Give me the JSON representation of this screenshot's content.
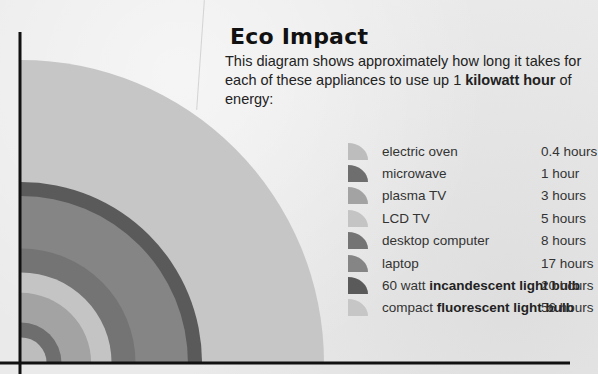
{
  "header": {
    "title": "Eco Impact",
    "description_parts": [
      "This diagram shows approximately how long it takes for each of these appliances to use up 1 ",
      "kilowatt hour",
      " of energy:"
    ]
  },
  "legend": {
    "items": [
      {
        "label": "electric oven",
        "label_bold": "",
        "label_suffix": "",
        "value": "0.4 hours",
        "color": "#bdbdbd"
      },
      {
        "label": "microwave",
        "label_bold": "",
        "label_suffix": "",
        "value": "1 hour",
        "color": "#6e6e6e"
      },
      {
        "label": "plasma TV",
        "label_bold": "",
        "label_suffix": "",
        "value": "3 hours",
        "color": "#a3a3a3"
      },
      {
        "label": "LCD TV",
        "label_bold": "",
        "label_suffix": "",
        "value": "5 hours",
        "color": "#c4c4c4"
      },
      {
        "label": "desktop computer",
        "label_bold": "",
        "label_suffix": "",
        "value": "8 hours",
        "color": "#747474"
      },
      {
        "label": "laptop",
        "label_bold": "",
        "label_suffix": "",
        "value": "17 hours",
        "color": "#858585"
      },
      {
        "label": "60 watt ",
        "label_bold": "incandescent light bulb",
        "label_suffix": "",
        "value": "20 hours",
        "color": "#5a5a5a"
      },
      {
        "label": "compact ",
        "label_bold": "fluorescent light bulb",
        "label_suffix": "",
        "value": "56 hours",
        "color": "#c6c6c6"
      }
    ]
  },
  "chart_data": {
    "type": "quarter-circle area (concentric)",
    "title": "Eco Impact",
    "subtitle": "This diagram shows approximately how long it takes for each of these appliances to use up 1 kilowatt hour of energy:",
    "categories": [
      "electric oven",
      "microwave",
      "plasma TV",
      "LCD TV",
      "desktop computer",
      "laptop",
      "60 watt incandescent light bulb",
      "compact fluorescent light bulb"
    ],
    "values": [
      0.4,
      1,
      3,
      5,
      8,
      17,
      20,
      56
    ],
    "unit": "hours",
    "legend_position": "right",
    "grid": false
  },
  "colors": {
    "axis": "#111111",
    "background": "#eaeaea"
  }
}
